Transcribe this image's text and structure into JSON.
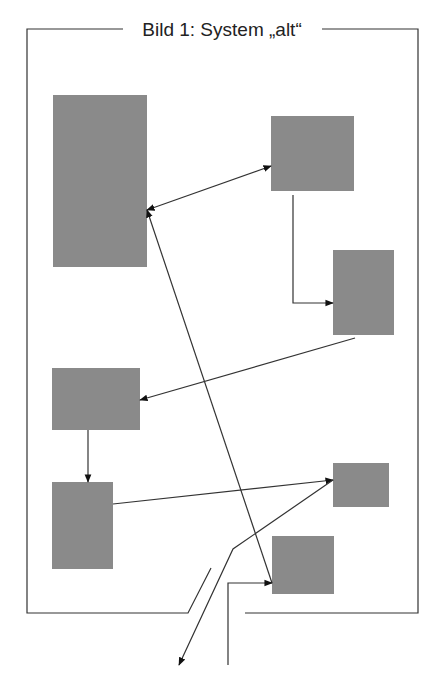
{
  "title": "Bild 1: System „alt“",
  "colors": {
    "box_fill": "#8a8a8a",
    "line": "#333333",
    "background": "#ffffff"
  },
  "frame": {
    "top_y": 29,
    "left_x": 27,
    "right_x": 418,
    "bottom_y": 613,
    "title_gap": [
      123,
      322
    ],
    "bottom_gap": [
      188,
      245
    ]
  },
  "boxes": [
    {
      "id": "box-1",
      "x": 53,
      "y": 95,
      "w": 94,
      "h": 172
    },
    {
      "id": "box-2",
      "x": 271,
      "y": 116,
      "w": 83,
      "h": 75
    },
    {
      "id": "box-3",
      "x": 333,
      "y": 250,
      "w": 61,
      "h": 85
    },
    {
      "id": "box-4",
      "x": 52,
      "y": 368,
      "w": 88,
      "h": 62
    },
    {
      "id": "box-5",
      "x": 52,
      "y": 482,
      "w": 61,
      "h": 87
    },
    {
      "id": "box-6",
      "x": 333,
      "y": 463,
      "w": 56,
      "h": 44
    },
    {
      "id": "box-7",
      "x": 272,
      "y": 536,
      "w": 62,
      "h": 58
    }
  ],
  "connections": [
    {
      "id": "box1-box2",
      "points": [
        [
          147,
          210
        ],
        [
          271,
          166
        ]
      ],
      "arrow_start": true,
      "arrow_end": true
    },
    {
      "id": "box2-box3",
      "points": [
        [
          293,
          195
        ],
        [
          293,
          303
        ],
        [
          333,
          303
        ]
      ],
      "arrow_start": false,
      "arrow_end": true
    },
    {
      "id": "box3-box4",
      "points": [
        [
          355,
          338
        ],
        [
          140,
          400
        ]
      ],
      "arrow_start": false,
      "arrow_end": true
    },
    {
      "id": "box4-box5",
      "points": [
        [
          88,
          430
        ],
        [
          88,
          482
        ]
      ],
      "arrow_start": false,
      "arrow_end": true
    },
    {
      "id": "box5-box6",
      "points": [
        [
          113,
          504
        ],
        [
          333,
          480
        ]
      ],
      "arrow_start": false,
      "arrow_end": true
    },
    {
      "id": "box7-box1",
      "points": [
        [
          272,
          583
        ],
        [
          147,
          210
        ]
      ],
      "arrow_start": false,
      "arrow_end": true
    },
    {
      "id": "box6-external-out",
      "points": [
        [
          333,
          480
        ],
        [
          233,
          549
        ],
        [
          179,
          665
        ]
      ],
      "arrow_start": false,
      "arrow_end": true
    },
    {
      "id": "external-in-box7",
      "points": [
        [
          228,
          665
        ],
        [
          228,
          583
        ],
        [
          272,
          583
        ]
      ],
      "arrow_start": false,
      "arrow_end": true
    }
  ]
}
